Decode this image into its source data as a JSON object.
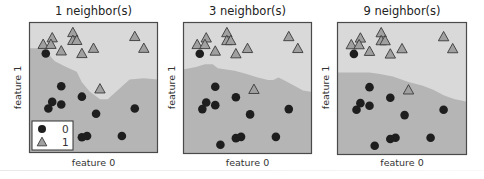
{
  "chart_data": [
    {
      "type": "scatter",
      "title": "1 neighbor(s)",
      "xlabel": "feature 0",
      "ylabel": "feature 1",
      "n_neighbors": 1,
      "grid": false,
      "ticks": false,
      "legend": {
        "position": "lower left",
        "entries": [
          "0",
          "1"
        ]
      },
      "region_colors": {
        "class_0": "#b5b5b5",
        "class_1": "#d9d9d9"
      },
      "boundary": [
        [
          0,
          0.2
        ],
        [
          0.11,
          0.2
        ],
        [
          0.2,
          0.3
        ],
        [
          0.28,
          0.34
        ],
        [
          0.37,
          0.38
        ],
        [
          0.41,
          0.46
        ],
        [
          0.47,
          0.53
        ],
        [
          0.55,
          0.59
        ],
        [
          0.61,
          0.59
        ],
        [
          0.69,
          0.52
        ],
        [
          0.78,
          0.44
        ],
        [
          0.89,
          0.43
        ],
        [
          1,
          0.44
        ]
      ]
    },
    {
      "type": "scatter",
      "title": "3 neighbor(s)",
      "xlabel": "feature 0",
      "ylabel": "feature 1",
      "n_neighbors": 3,
      "grid": false,
      "ticks": false,
      "region_colors": {
        "class_0": "#b5b5b5",
        "class_1": "#d9d9d9"
      },
      "boundary": [
        [
          0,
          0.36
        ],
        [
          0.1,
          0.34
        ],
        [
          0.17,
          0.32
        ],
        [
          0.23,
          0.32
        ],
        [
          0.27,
          0.35
        ],
        [
          0.4,
          0.37
        ],
        [
          0.48,
          0.39
        ],
        [
          0.58,
          0.42
        ],
        [
          0.66,
          0.44
        ],
        [
          0.7,
          0.44
        ],
        [
          0.74,
          0.42
        ],
        [
          0.78,
          0.44
        ],
        [
          0.86,
          0.48
        ],
        [
          0.93,
          0.52
        ],
        [
          1,
          0.53
        ]
      ]
    },
    {
      "type": "scatter",
      "title": "9 neighbor(s)",
      "xlabel": "feature 0",
      "ylabel": "feature 1",
      "n_neighbors": 9,
      "grid": false,
      "ticks": false,
      "region_colors": {
        "class_0": "#b5b5b5",
        "class_1": "#d9d9d9"
      },
      "boundary": [
        [
          0,
          0.38
        ],
        [
          0.15,
          0.38
        ],
        [
          0.25,
          0.38
        ],
        [
          0.33,
          0.39
        ],
        [
          0.43,
          0.41
        ],
        [
          0.55,
          0.45
        ],
        [
          0.66,
          0.48
        ],
        [
          0.74,
          0.51
        ],
        [
          0.82,
          0.55
        ],
        [
          0.9,
          0.58
        ],
        [
          1,
          0.6
        ]
      ]
    }
  ],
  "points": {
    "class_1_triangles": [
      [
        0.11,
        0.17
      ],
      [
        0.18,
        0.12
      ],
      [
        0.17,
        0.17
      ],
      [
        0.25,
        0.22
      ],
      [
        0.34,
        0.08
      ],
      [
        0.34,
        0.14
      ],
      [
        0.37,
        0.14
      ],
      [
        0.41,
        0.24
      ],
      [
        0.5,
        0.2
      ],
      [
        0.82,
        0.11
      ],
      [
        0.89,
        0.2
      ],
      [
        0.55,
        0.51
      ]
    ],
    "class_0_circles": [
      [
        0.13,
        0.24
      ],
      [
        0.25,
        0.49
      ],
      [
        0.41,
        0.57
      ],
      [
        0.18,
        0.61
      ],
      [
        0.15,
        0.66
      ],
      [
        0.25,
        0.63
      ],
      [
        0.52,
        0.7
      ],
      [
        0.82,
        0.66
      ],
      [
        0.41,
        0.88
      ],
      [
        0.45,
        0.87
      ],
      [
        0.29,
        0.93
      ],
      [
        0.72,
        0.87
      ]
    ]
  },
  "colors": {
    "circle_fill": "#1e1e1e",
    "triangle_fill": "#a0a0a0",
    "triangle_stroke": "#3a3a3a",
    "frame": "#4a4a4a"
  },
  "legend": {
    "items": [
      {
        "marker": "circle",
        "label": "0"
      },
      {
        "marker": "triangle",
        "label": "1"
      }
    ]
  },
  "panels": [
    {
      "title": "1 neighbor(s)",
      "xlabel": "feature 0",
      "ylabel": "feature 1"
    },
    {
      "title": "3 neighbor(s)",
      "xlabel": "feature 0",
      "ylabel": "feature 1"
    },
    {
      "title": "9 neighbor(s)",
      "xlabel": "feature 0",
      "ylabel": "feature 1"
    }
  ]
}
